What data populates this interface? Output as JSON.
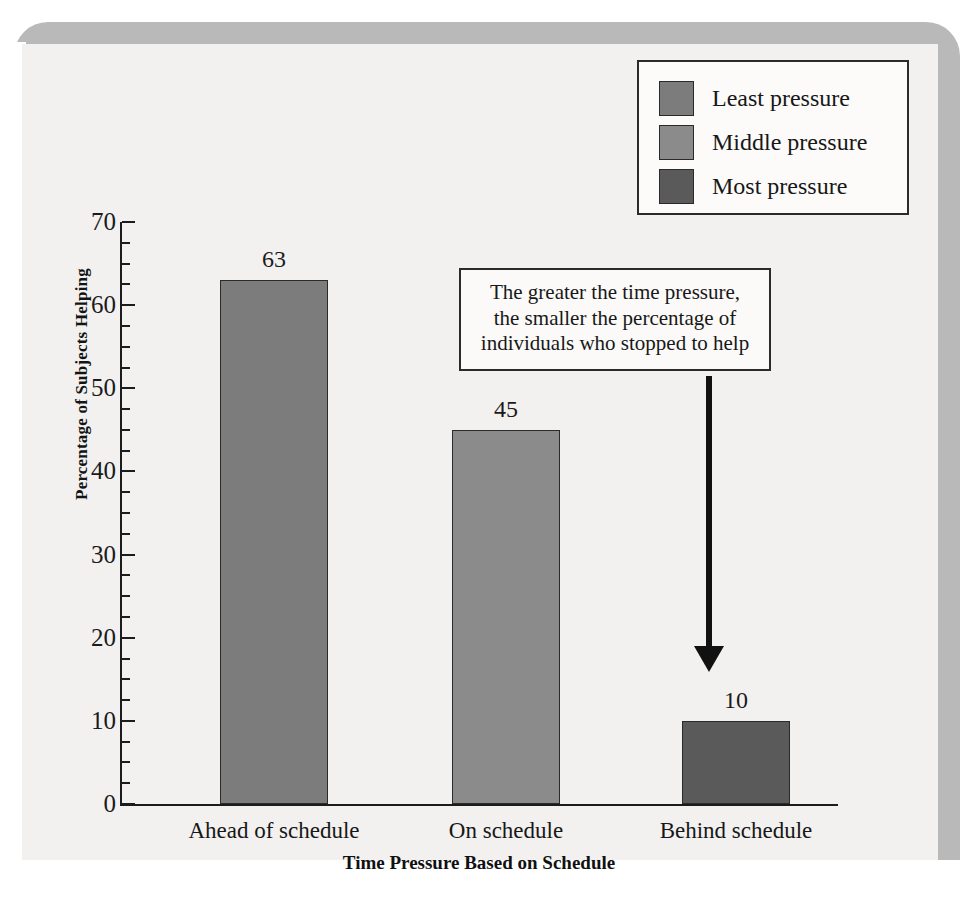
{
  "chart_data": {
    "type": "bar",
    "title": "",
    "categories": [
      "Ahead of schedule",
      "On schedule",
      "Behind schedule"
    ],
    "values": [
      63,
      45,
      10
    ],
    "series": [
      {
        "name": "Least pressure",
        "value": 63,
        "color": "#7c7c7c"
      },
      {
        "name": "Middle pressure",
        "value": 45,
        "color": "#8b8b8b"
      },
      {
        "name": "Most pressure",
        "value": 10,
        "color": "#5a5a5a"
      }
    ],
    "xlabel": "Time Pressure Based on Schedule",
    "ylabel": "Percentage of Subjects Helping",
    "ylim": [
      0,
      70
    ],
    "ytick_step": 10,
    "yminor_step": 2.5,
    "ytick_labels": [
      "0",
      "10",
      "20",
      "30",
      "40",
      "50",
      "60",
      "70"
    ],
    "grid": false,
    "legend_position": "top-right",
    "annotations": [
      "The greater the time pressure,",
      "the smaller the percentage of",
      "individuals who stopped to help"
    ]
  },
  "legend": {
    "items": [
      {
        "label": "Least pressure",
        "color": "#7c7c7c"
      },
      {
        "label": "Middle pressure",
        "color": "#8b8b8b"
      },
      {
        "label": "Most pressure",
        "color": "#5a5a5a"
      }
    ]
  },
  "axes": {
    "y_title": "Percentage of Subjects Helping",
    "x_title": "Time Pressure Based on Schedule",
    "y_ticks": [
      "70",
      "60",
      "50",
      "40",
      "30",
      "20",
      "10",
      "0"
    ]
  },
  "bars": [
    {
      "category": "Ahead of schedule",
      "value": 63,
      "value_label": "63",
      "color": "#7c7c7c"
    },
    {
      "category": "On schedule",
      "value": 45,
      "value_label": "45",
      "color": "#8b8b8b"
    },
    {
      "category": "Behind schedule",
      "value": 10,
      "value_label": "10",
      "color": "#5a5a5a"
    }
  ],
  "annotation": {
    "line1": "The greater the time pressure,",
    "line2": "the smaller the percentage of",
    "line3": "individuals who stopped to help"
  },
  "colors": {
    "page_band": "#b9b9b9",
    "plot_background": "#f2f1ef",
    "axis": "#1c1c1c",
    "text": "#181818"
  }
}
